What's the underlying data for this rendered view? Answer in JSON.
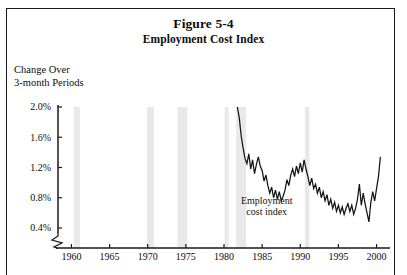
{
  "figure": {
    "title": "Figure 5-4",
    "subtitle": "Employment Cost Index",
    "axis_caption": "Change Over\n3-month Periods"
  },
  "chart_data": {
    "type": "line",
    "title": "Figure 5-4",
    "subtitle": "Employment Cost Index",
    "xlabel": "",
    "ylabel": "Change Over 3-month Periods",
    "xlim": [
      1958.5,
      2001.5
    ],
    "ylim": [
      0.15,
      2.05
    ],
    "grid": false,
    "legend_position": "inline-annotation",
    "y_axis_break": true,
    "y_tick_labels": [
      "0.4%",
      "0.8%",
      "1.2%",
      "1.6%",
      "2.0%"
    ],
    "y_ticks": [
      0.4,
      0.8,
      1.2,
      1.6,
      2.0
    ],
    "x_tick_labels": [
      "1960",
      "1965",
      "1970",
      "1975",
      "1980",
      "1985",
      "1990",
      "1995",
      "2000"
    ],
    "x_ticks": [
      1960,
      1965,
      1970,
      1975,
      1980,
      1985,
      1990,
      1995,
      2000
    ],
    "annotations": [
      {
        "text": "Employment cost index",
        "x": 1985.6,
        "y": 0.72
      }
    ],
    "shaded_bands": {
      "label": "recession-band",
      "color": "#e9e9e9",
      "ranges": [
        [
          1960.3,
          1961.1
        ],
        [
          1969.9,
          1970.8
        ],
        [
          1973.9,
          1975.2
        ],
        [
          1980.1,
          1980.6
        ],
        [
          1981.6,
          1982.9
        ],
        [
          1990.6,
          1991.2
        ]
      ]
    },
    "series": [
      {
        "name": "Employment cost index",
        "color": "#141414",
        "x": [
          1981.75,
          1982.0,
          1982.25,
          1982.5,
          1982.75,
          1983.0,
          1983.25,
          1983.5,
          1983.75,
          1984.0,
          1984.25,
          1984.5,
          1984.75,
          1985.0,
          1985.25,
          1985.5,
          1985.75,
          1986.0,
          1986.25,
          1986.5,
          1986.75,
          1987.0,
          1987.25,
          1987.5,
          1987.75,
          1988.0,
          1988.25,
          1988.5,
          1988.75,
          1989.0,
          1989.25,
          1989.5,
          1989.75,
          1990.0,
          1990.25,
          1990.5,
          1990.75,
          1991.0,
          1991.25,
          1991.5,
          1991.75,
          1992.0,
          1992.25,
          1992.5,
          1992.75,
          1993.0,
          1993.25,
          1993.5,
          1993.75,
          1994.0,
          1994.25,
          1994.5,
          1994.75,
          1995.0,
          1995.25,
          1995.5,
          1995.75,
          1996.0,
          1996.25,
          1996.5,
          1996.75,
          1997.0,
          1997.25,
          1997.5,
          1997.75,
          1998.0,
          1998.25,
          1998.5,
          1998.75,
          1999.0,
          1999.25,
          1999.5,
          1999.75,
          2000.0,
          2000.25,
          2000.5
        ],
        "values": [
          2.02,
          1.86,
          1.62,
          1.46,
          1.32,
          1.25,
          1.38,
          1.18,
          1.3,
          1.12,
          1.24,
          1.34,
          1.22,
          1.16,
          1.02,
          1.1,
          0.96,
          0.86,
          0.94,
          0.8,
          0.9,
          0.78,
          0.88,
          0.76,
          0.82,
          0.9,
          1.04,
          0.96,
          1.1,
          1.18,
          1.08,
          1.22,
          1.12,
          1.26,
          1.14,
          1.3,
          1.18,
          1.08,
          0.96,
          1.06,
          0.92,
          0.98,
          0.86,
          0.94,
          0.8,
          0.88,
          0.76,
          0.84,
          0.7,
          0.78,
          0.66,
          0.74,
          0.62,
          0.7,
          0.6,
          0.68,
          0.58,
          0.66,
          0.72,
          0.62,
          0.7,
          0.58,
          0.66,
          0.78,
          0.98,
          0.7,
          0.86,
          0.72,
          0.6,
          0.48,
          0.74,
          0.88,
          0.76,
          0.92,
          1.08,
          1.34
        ]
      }
    ]
  }
}
